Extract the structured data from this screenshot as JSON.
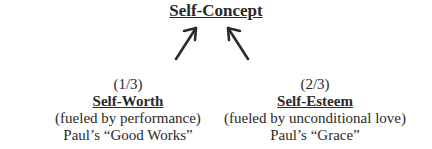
{
  "diagram": {
    "title": "Self-Concept",
    "nodes": [
      {
        "fraction": "(1/3)",
        "heading": "Self-Worth",
        "description": "(fueled by performance)",
        "reference": "Paul’s “Good Works”"
      },
      {
        "fraction": "(2/3)",
        "heading": "Self-Esteem",
        "description": "(fueled by unconditional love)",
        "reference": "Paul’s “Grace”"
      }
    ],
    "edges": [
      {
        "from": "Self-Worth",
        "to": "Self-Concept"
      },
      {
        "from": "Self-Esteem",
        "to": "Self-Concept"
      }
    ],
    "colors": {
      "text": "#2a2a2a",
      "arrow": "#2a2a2a",
      "background": "#ffffff"
    }
  }
}
